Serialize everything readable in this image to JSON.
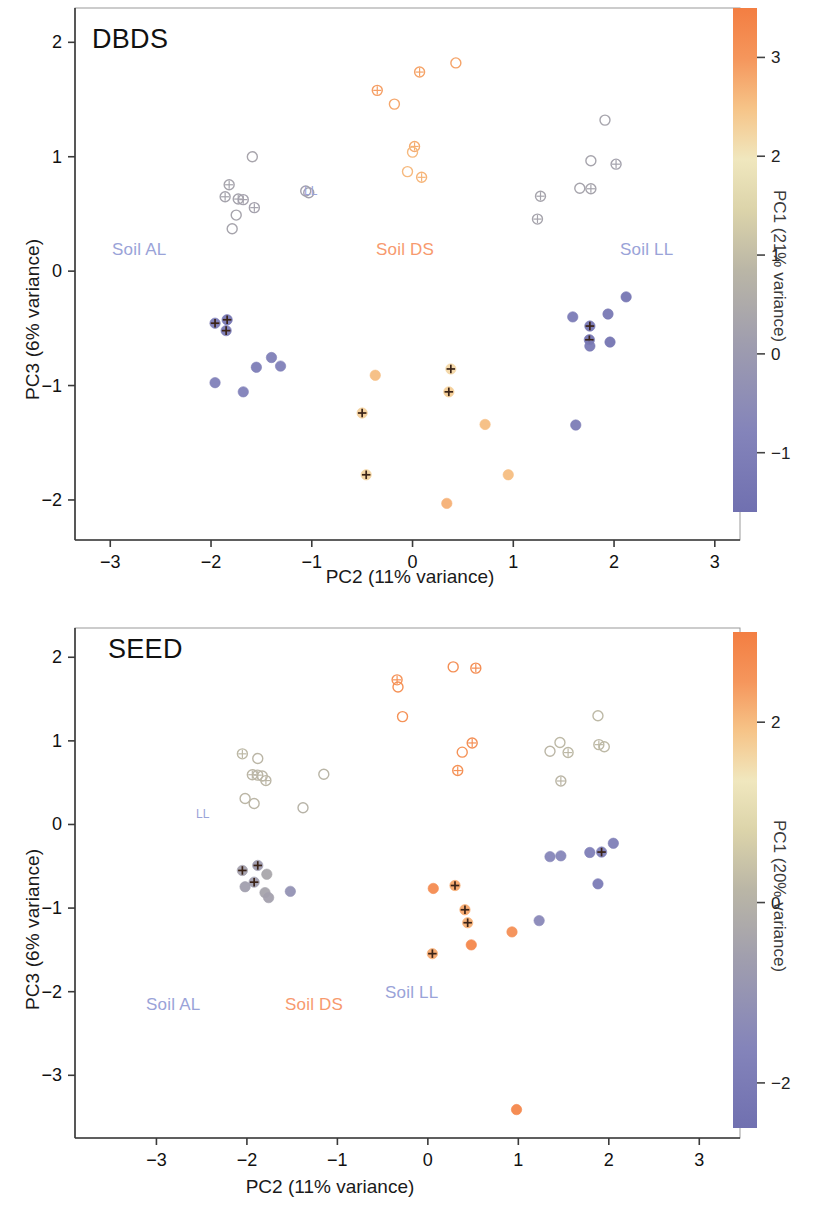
{
  "figure": {
    "type": "scatter-pca-figure",
    "panels": [
      "DBDS",
      "SEED"
    ]
  },
  "panel_dbds": {
    "title": "DBDS",
    "xlabel": "PC2 (11% variance)",
    "ylabel": "PC3 (6% variance)",
    "colorbar_label": "PC1 (21% variance)",
    "xticks": [
      "-3",
      "-2",
      "-1",
      "0",
      "1",
      "2",
      "3"
    ],
    "yticks": [
      "2",
      "1",
      "0",
      "-1",
      "-2"
    ],
    "cbticks": [
      "3",
      "2",
      "1",
      "0",
      "-1"
    ],
    "soil_al": "Soil AL",
    "soil_ds": "Soil DS",
    "soil_ll": "Soil LL",
    "ll_annotation": "LL"
  },
  "panel_seed": {
    "title": "SEED",
    "xlabel": "PC2 (11% variance)",
    "ylabel": "PC3 (6% variance)",
    "colorbar_label": "PC1 (20% variance)",
    "xticks": [
      "-3",
      "-2",
      "-1",
      "0",
      "1",
      "2",
      "3"
    ],
    "yticks": [
      "2",
      "1",
      "0",
      "-1",
      "-2",
      "-3"
    ],
    "cbticks": [
      "2",
      "0",
      "-2"
    ],
    "soil_al": "Soil AL",
    "soil_ds": "Soil DS",
    "soil_ll": "Soil LL",
    "ll_annotation": "LL"
  },
  "colors": {
    "orange": "#f2814a",
    "orange_pale": "#f6a477",
    "periwinkle": "#9aa3d8",
    "periwinkle_dark": "#6f72b0",
    "grey": "#b9b5ab",
    "cream": "#f0e7c4",
    "label_blue": "#9aa3d8",
    "label_orange": "#f79a6e",
    "axis": "#3a3a3a"
  },
  "chart_data": [
    {
      "type": "scatter",
      "title": "DBDS",
      "xlabel": "PC2 (11% variance)",
      "ylabel": "PC3 (6% variance)",
      "colorbar_label": "PC1 (21% variance)",
      "xlim": [
        -3.35,
        3.25
      ],
      "ylim": [
        -2.35,
        2.3
      ],
      "xticks": [
        -3,
        -2,
        -1,
        0,
        1,
        2,
        3
      ],
      "yticks": [
        -2,
        -1,
        0,
        1,
        2
      ],
      "colorbar_range": [
        -1.6,
        3.5
      ],
      "colorbar_ticks": [
        -1,
        0,
        1,
        2,
        3
      ],
      "grid": false,
      "legend_position": "in-plot-text",
      "annotations": [
        {
          "text": "Soil AL",
          "x": -2.35,
          "y": 0.12,
          "color": "#9aa3d8"
        },
        {
          "text": "Soil DS",
          "x": -0.06,
          "y": 0.12,
          "color": "#f79a6e"
        },
        {
          "text": "Soil LL",
          "x": 1.85,
          "y": 0.12,
          "color": "#9aa3d8"
        },
        {
          "text": "LL",
          "x": -0.96,
          "y": 0.7,
          "color": "#9aa3d8"
        }
      ],
      "series": [
        {
          "name": "Soil AL - open (high PC1 / light)",
          "marker": "open-circle",
          "points": [
            {
              "x": -1.59,
              "y": 1.0,
              "c": 0.35,
              "cross": false
            },
            {
              "x": -1.82,
              "y": 0.755,
              "c": 0.3,
              "cross": true
            },
            {
              "x": -1.86,
              "y": 0.65,
              "c": 0.28,
              "cross": true
            },
            {
              "x": -1.73,
              "y": 0.63,
              "c": 0.28,
              "cross": true
            },
            {
              "x": -1.68,
              "y": 0.625,
              "c": 0.26,
              "cross": true
            },
            {
              "x": -1.57,
              "y": 0.555,
              "c": 0.26,
              "cross": true
            },
            {
              "x": -1.75,
              "y": 0.49,
              "c": 0.3,
              "cross": false
            },
            {
              "x": -1.79,
              "y": 0.37,
              "c": 0.3,
              "cross": false
            },
            {
              "x": -1.06,
              "y": 0.7,
              "c": 0.2,
              "cross": false
            },
            {
              "x": -1.03,
              "y": 0.685,
              "c": 0.2,
              "cross": false
            }
          ]
        },
        {
          "name": "Soil AL - filled (low PC1 / purple)",
          "marker": "filled-circle",
          "points": [
            {
              "x": -1.96,
              "y": -0.455,
              "c": -1.15,
              "cross": true
            },
            {
              "x": -1.84,
              "y": -0.425,
              "c": -1.3,
              "cross": true
            },
            {
              "x": -1.85,
              "y": -0.52,
              "c": -1.25,
              "cross": true
            },
            {
              "x": -1.96,
              "y": -0.975,
              "c": -0.9,
              "cross": false
            },
            {
              "x": -1.68,
              "y": -1.055,
              "c": -0.9,
              "cross": false
            },
            {
              "x": -1.55,
              "y": -0.84,
              "c": -1.05,
              "cross": false
            },
            {
              "x": -1.4,
              "y": -0.755,
              "c": -1.0,
              "cross": false
            },
            {
              "x": -1.31,
              "y": -0.83,
              "c": -0.95,
              "cross": false
            }
          ]
        },
        {
          "name": "Soil DS - open (high PC1 / orange)",
          "marker": "open-circle",
          "points": [
            {
              "x": 0.43,
              "y": 1.82,
              "c": 2.85,
              "cross": false
            },
            {
              "x": 0.07,
              "y": 1.74,
              "c": 2.85,
              "cross": true
            },
            {
              "x": -0.35,
              "y": 1.58,
              "c": 2.9,
              "cross": true
            },
            {
              "x": -0.18,
              "y": 1.46,
              "c": 2.8,
              "cross": false
            },
            {
              "x": 0.02,
              "y": 1.09,
              "c": 2.75,
              "cross": true
            },
            {
              "x": 0.0,
              "y": 1.04,
              "c": 2.6,
              "cross": false
            },
            {
              "x": -0.05,
              "y": 0.87,
              "c": 2.6,
              "cross": false
            },
            {
              "x": 0.09,
              "y": 0.82,
              "c": 2.65,
              "cross": true
            }
          ]
        },
        {
          "name": "Soil DS - filled (orange)",
          "marker": "filled-circle",
          "points": [
            {
              "x": -0.37,
              "y": -0.91,
              "c": 2.55,
              "cross": false
            },
            {
              "x": 0.38,
              "y": -0.855,
              "c": 2.2,
              "cross": true
            },
            {
              "x": 0.36,
              "y": -1.055,
              "c": 2.35,
              "cross": true
            },
            {
              "x": -0.5,
              "y": -1.24,
              "c": 2.3,
              "cross": true
            },
            {
              "x": 0.72,
              "y": -1.34,
              "c": 2.55,
              "cross": false
            },
            {
              "x": -0.46,
              "y": -1.78,
              "c": 2.25,
              "cross": true
            },
            {
              "x": 0.95,
              "y": -1.78,
              "c": 2.55,
              "cross": false
            },
            {
              "x": 0.34,
              "y": -2.03,
              "c": 2.7,
              "cross": false
            }
          ]
        },
        {
          "name": "Soil LL - open (light)",
          "marker": "open-circle",
          "points": [
            {
              "x": 1.91,
              "y": 1.32,
              "c": 0.3,
              "cross": false
            },
            {
              "x": 1.77,
              "y": 0.965,
              "c": 0.3,
              "cross": false
            },
            {
              "x": 2.02,
              "y": 0.935,
              "c": 0.25,
              "cross": true
            },
            {
              "x": 1.27,
              "y": 0.655,
              "c": 0.3,
              "cross": true
            },
            {
              "x": 1.66,
              "y": 0.725,
              "c": 0.3,
              "cross": false
            },
            {
              "x": 1.77,
              "y": 0.72,
              "c": 0.3,
              "cross": true
            },
            {
              "x": 1.24,
              "y": 0.455,
              "c": 0.3,
              "cross": true
            }
          ]
        },
        {
          "name": "Soil LL - filled (purple)",
          "marker": "filled-circle",
          "points": [
            {
              "x": 2.12,
              "y": -0.225,
              "c": -1.35,
              "cross": false
            },
            {
              "x": 1.94,
              "y": -0.375,
              "c": -1.25,
              "cross": false
            },
            {
              "x": 1.59,
              "y": -0.4,
              "c": -1.15,
              "cross": false
            },
            {
              "x": 1.76,
              "y": -0.48,
              "c": -1.4,
              "cross": true
            },
            {
              "x": 1.755,
              "y": -0.6,
              "c": -1.45,
              "cross": true
            },
            {
              "x": 1.76,
              "y": -0.655,
              "c": -1.2,
              "cross": false
            },
            {
              "x": 1.96,
              "y": -0.62,
              "c": -1.4,
              "cross": false
            },
            {
              "x": 1.62,
              "y": -1.345,
              "c": -1.1,
              "cross": false
            }
          ]
        }
      ]
    },
    {
      "type": "scatter",
      "title": "SEED",
      "xlabel": "PC2 (11% variance)",
      "ylabel": "PC3 (6% variance)",
      "colorbar_label": "PC1 (20% variance)",
      "xlim": [
        -3.9,
        3.45
      ],
      "ylim": [
        -3.75,
        2.35
      ],
      "xticks": [
        -3,
        -2,
        -1,
        0,
        1,
        2,
        3
      ],
      "yticks": [
        -3,
        -2,
        -1,
        0,
        1,
        2
      ],
      "colorbar_range": [
        -2.5,
        3.0
      ],
      "colorbar_ticks": [
        -2,
        0,
        2
      ],
      "grid": false,
      "legend_position": "in-plot-text",
      "annotations": [
        {
          "text": "Soil AL",
          "x": -1.95,
          "y": -2.12,
          "color": "#9aa3d8"
        },
        {
          "text": "Soil DS",
          "x": 0.22,
          "y": -2.12,
          "color": "#f79a6e"
        },
        {
          "text": "Soil LL",
          "x": 1.62,
          "y": -1.97,
          "color": "#9aa3d8"
        }
      ],
      "series": [
        {
          "name": "Soil AL - open (light grey)",
          "marker": "open-circle",
          "points": [
            {
              "x": -2.05,
              "y": 0.845,
              "c": 0.2,
              "cross": true
            },
            {
              "x": -1.88,
              "y": 0.79,
              "c": 0.15,
              "cross": false
            },
            {
              "x": -1.94,
              "y": 0.595,
              "c": 0.15,
              "cross": true
            },
            {
              "x": -1.88,
              "y": 0.59,
              "c": 0.15,
              "cross": true
            },
            {
              "x": -1.83,
              "y": 0.58,
              "c": 0.15,
              "cross": false
            },
            {
              "x": -1.79,
              "y": 0.525,
              "c": 0.15,
              "cross": true
            },
            {
              "x": -2.02,
              "y": 0.31,
              "c": 0.15,
              "cross": false
            },
            {
              "x": -1.92,
              "y": 0.25,
              "c": 0.15,
              "cross": false
            },
            {
              "x": -1.15,
              "y": 0.6,
              "c": 0.1,
              "cross": false
            },
            {
              "x": -1.38,
              "y": 0.2,
              "c": 0.05,
              "cross": false
            }
          ]
        },
        {
          "name": "Soil AL - filled (dark grey)",
          "marker": "filled-circle",
          "points": [
            {
              "x": -2.05,
              "y": -0.55,
              "c": -0.55,
              "cross": true
            },
            {
              "x": -1.88,
              "y": -0.49,
              "c": -0.75,
              "cross": true
            },
            {
              "x": -2.02,
              "y": -0.745,
              "c": -0.6,
              "cross": false
            },
            {
              "x": -1.92,
              "y": -0.69,
              "c": -0.65,
              "cross": true
            },
            {
              "x": -1.78,
              "y": -0.595,
              "c": -0.35,
              "cross": false
            },
            {
              "x": -1.8,
              "y": -0.815,
              "c": -0.45,
              "cross": false
            },
            {
              "x": -1.76,
              "y": -0.875,
              "c": -0.55,
              "cross": false
            },
            {
              "x": -1.52,
              "y": -0.8,
              "c": -1.1,
              "cross": false
            }
          ]
        },
        {
          "name": "Soil DS - open (orange)",
          "marker": "open-circle",
          "points": [
            {
              "x": 0.28,
              "y": 1.885,
              "c": 2.6,
              "cross": false
            },
            {
              "x": 0.53,
              "y": 1.87,
              "c": 2.65,
              "cross": true
            },
            {
              "x": -0.34,
              "y": 1.73,
              "c": 2.55,
              "cross": true
            },
            {
              "x": -0.33,
              "y": 1.645,
              "c": 2.55,
              "cross": false
            },
            {
              "x": -0.28,
              "y": 1.29,
              "c": 2.55,
              "cross": false
            },
            {
              "x": 0.49,
              "y": 0.975,
              "c": 2.6,
              "cross": true
            },
            {
              "x": 0.38,
              "y": 0.865,
              "c": 2.55,
              "cross": false
            },
            {
              "x": 0.33,
              "y": 0.645,
              "c": 2.55,
              "cross": true
            }
          ]
        },
        {
          "name": "Soil DS - filled (orange)",
          "marker": "filled-circle",
          "points": [
            {
              "x": 0.06,
              "y": -0.765,
              "c": 2.7,
              "cross": false
            },
            {
              "x": 0.3,
              "y": -0.73,
              "c": 2.25,
              "cross": true
            },
            {
              "x": 0.41,
              "y": -1.02,
              "c": 2.25,
              "cross": true
            },
            {
              "x": 0.44,
              "y": -1.175,
              "c": 2.15,
              "cross": true
            },
            {
              "x": 0.93,
              "y": -1.285,
              "c": 2.6,
              "cross": false
            },
            {
              "x": 0.48,
              "y": -1.44,
              "c": 2.8,
              "cross": false
            },
            {
              "x": 0.05,
              "y": -1.545,
              "c": 2.25,
              "cross": true
            },
            {
              "x": 0.98,
              "y": -3.41,
              "c": 2.8,
              "cross": false
            }
          ]
        },
        {
          "name": "Soil LL - open (light)",
          "marker": "open-circle",
          "points": [
            {
              "x": 1.88,
              "y": 1.3,
              "c": 0.2,
              "cross": false
            },
            {
              "x": 1.46,
              "y": 0.98,
              "c": 0.2,
              "cross": false
            },
            {
              "x": 1.89,
              "y": 0.955,
              "c": 0.2,
              "cross": true
            },
            {
              "x": 1.95,
              "y": 0.93,
              "c": 0.2,
              "cross": false
            },
            {
              "x": 1.35,
              "y": 0.875,
              "c": 0.15,
              "cross": false
            },
            {
              "x": 1.55,
              "y": 0.86,
              "c": 0.2,
              "cross": true
            },
            {
              "x": 1.47,
              "y": 0.52,
              "c": 0.15,
              "cross": true
            }
          ]
        },
        {
          "name": "Soil LL - filled (purple)",
          "marker": "filled-circle",
          "points": [
            {
              "x": 2.05,
              "y": -0.225,
              "c": -1.85,
              "cross": false
            },
            {
              "x": 1.35,
              "y": -0.385,
              "c": -1.55,
              "cross": false
            },
            {
              "x": 1.47,
              "y": -0.375,
              "c": -1.55,
              "cross": false
            },
            {
              "x": 1.79,
              "y": -0.335,
              "c": -1.9,
              "cross": false
            },
            {
              "x": 1.92,
              "y": -0.33,
              "c": -1.95,
              "cross": true
            },
            {
              "x": 1.88,
              "y": -0.71,
              "c": -2.0,
              "cross": false
            },
            {
              "x": 1.23,
              "y": -1.15,
              "c": -1.45,
              "cross": false
            }
          ]
        }
      ]
    }
  ]
}
